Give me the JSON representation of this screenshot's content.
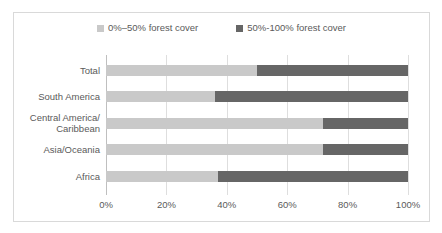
{
  "chart_data": {
    "type": "bar",
    "orientation": "horizontal",
    "stacked": true,
    "stack_mode": "percent",
    "title": "",
    "subtitle": "",
    "xlabel": "",
    "ylabel": "",
    "xlim": [
      0,
      100
    ],
    "xticks": [
      0,
      20,
      40,
      60,
      80,
      100
    ],
    "xtick_labels": [
      "0%",
      "20%",
      "40%",
      "60%",
      "80%",
      "100%"
    ],
    "grid": true,
    "grid_axis": "x",
    "legend_position": "top",
    "categories": [
      "Total",
      "South America",
      "Central America/ Caribbean",
      "Asia/Oceania",
      "Africa"
    ],
    "series": [
      {
        "name": "0%–50% forest cover",
        "color": "#c9c9c9",
        "values": [
          50,
          36,
          72,
          72,
          37
        ]
      },
      {
        "name": "50%-100% forest cover",
        "color": "#666666",
        "values": [
          50,
          64,
          28,
          28,
          63
        ]
      }
    ]
  },
  "legend": {
    "entries": [
      {
        "label": "0%–50% forest cover",
        "swatch_name": "legend-swatch-light"
      },
      {
        "label": "50%-100% forest cover",
        "swatch_name": "legend-swatch-dark"
      }
    ]
  },
  "axis": {
    "category_labels": [
      {
        "line1": "Total",
        "line2": ""
      },
      {
        "line1": "South America",
        "line2": ""
      },
      {
        "line1": "Central America/",
        "line2": "Caribbean"
      },
      {
        "line1": "Asia/Oceania",
        "line2": ""
      },
      {
        "line1": "Africa",
        "line2": ""
      }
    ],
    "tick_labels": [
      "0%",
      "20%",
      "40%",
      "60%",
      "80%",
      "100%"
    ]
  },
  "colors": {
    "series_light": "#c9c9c9",
    "series_dark": "#666666",
    "gridline": "#dedede",
    "axis": "#bfbfbf",
    "border": "#d9d9d9",
    "text": "#5a5a5a",
    "background": "#ffffff"
  }
}
